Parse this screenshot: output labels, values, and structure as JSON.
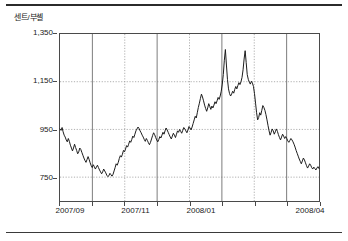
{
  "figure": {
    "y_unit_label": "센트/부셸"
  },
  "chart_data": {
    "type": "line",
    "title": "",
    "subtitle": "",
    "xlabel": "",
    "ylabel": "센트/부셸",
    "ylim": [
      650,
      1350
    ],
    "yticks": [
      750,
      950,
      1150,
      1350
    ],
    "ytick_labels": [
      "750",
      "950",
      "1,150",
      "1,350"
    ],
    "xlim": [
      "2007/09",
      "2008/04"
    ],
    "xticks": [
      "2007/09",
      "2007/11",
      "2008/01",
      "2008/04"
    ],
    "xtick_labels": [
      "2007/09",
      "2007/11",
      "2008/01",
      "2008/04"
    ],
    "xtick_positions": [
      0.042,
      0.293,
      0.544,
      0.962
    ],
    "grid": true,
    "grid_style": "dotted",
    "legend": "none",
    "line_color": "#1a1a1a",
    "series": [
      {
        "name": "가격",
        "values": [
          952,
          946,
          958,
          940,
          926,
          918,
          906,
          898,
          912,
          900,
          884,
          872,
          860,
          872,
          888,
          874,
          862,
          848,
          856,
          872,
          866,
          854,
          842,
          830,
          820,
          812,
          824,
          836,
          824,
          810,
          798,
          790,
          802,
          794,
          784,
          792,
          800,
          790,
          780,
          772,
          764,
          772,
          784,
          776,
          768,
          758,
          752,
          756,
          766,
          760,
          754,
          762,
          776,
          790,
          806,
          800,
          812,
          828,
          840,
          834,
          846,
          862,
          856,
          868,
          882,
          876,
          888,
          902,
          896,
          908,
          922,
          916,
          930,
          944,
          952,
          960,
          954,
          944,
          936,
          926,
          918,
          908,
          900,
          912,
          904,
          894,
          886,
          896,
          910,
          924,
          936,
          928,
          916,
          906,
          898,
          908,
          920,
          914,
          926,
          938,
          930,
          944,
          956,
          948,
          938,
          928,
          918,
          910,
          922,
          934,
          926,
          916,
          930,
          944,
          938,
          950,
          942,
          934,
          946,
          958,
          952,
          944,
          936,
          948,
          962,
          956,
          948,
          960,
          975,
          990,
          1005,
          998,
          1020,
          1042,
          1060,
          1080,
          1098,
          1086,
          1070,
          1052,
          1038,
          1026,
          1040,
          1058,
          1046,
          1034,
          1048,
          1040,
          1052,
          1066,
          1058,
          1070,
          1084,
          1076,
          1090,
          1110,
          1140,
          1180,
          1240,
          1285,
          1220,
          1160,
          1120,
          1100,
          1090,
          1098,
          1110,
          1102,
          1118,
          1130,
          1120,
          1134,
          1146,
          1138,
          1150,
          1168,
          1200,
          1245,
          1280,
          1230,
          1180,
          1160,
          1148,
          1140,
          1152,
          1144,
          1130,
          1100,
          1060,
          1020,
          990,
          1000,
          1020,
          1010,
          1030,
          1050,
          1042,
          1030,
          1012,
          990,
          966,
          944,
          926,
          938,
          952,
          944,
          930,
          940,
          952,
          942,
          928,
          916,
          906,
          918,
          930,
          922,
          912,
          920,
          912,
          902,
          896,
          904,
          912,
          906,
          898,
          888,
          876,
          862,
          850,
          838,
          826,
          816,
          806,
          818,
          830,
          822,
          810,
          798,
          788,
          796,
          806,
          800,
          790,
          784,
          792,
          786,
          780,
          788,
          794,
          786
        ]
      }
    ]
  }
}
